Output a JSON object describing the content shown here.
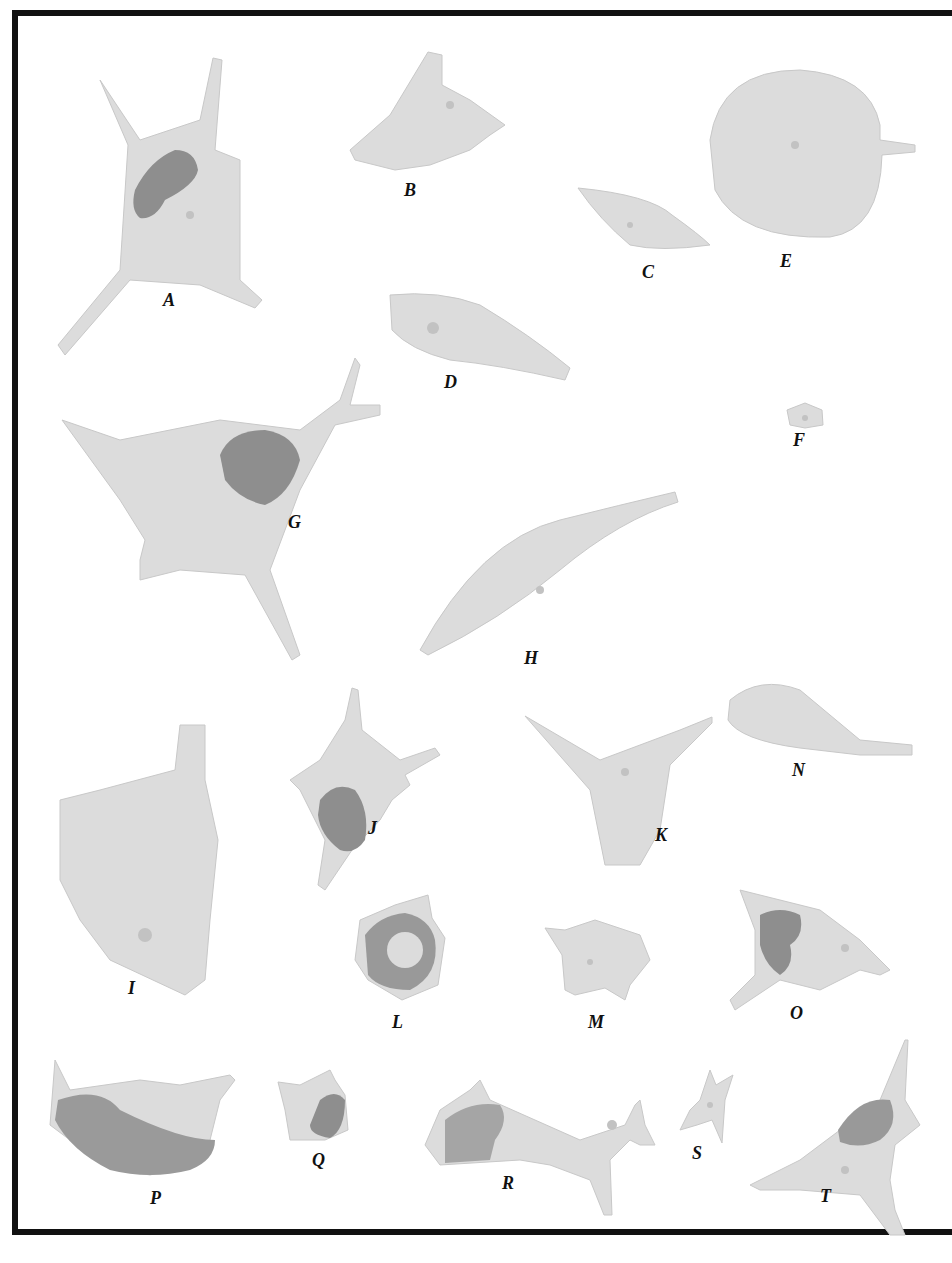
{
  "figure": {
    "colors": {
      "cell": "#dcdcdc",
      "cell_edge": "#c4c4c4",
      "nucleus": "#8e8e8e",
      "border": "#111111",
      "background": "#ffffff"
    },
    "labels": [
      {
        "id": "A",
        "x": 163,
        "y": 290
      },
      {
        "id": "B",
        "x": 404,
        "y": 180
      },
      {
        "id": "C",
        "x": 642,
        "y": 262
      },
      {
        "id": "D",
        "x": 444,
        "y": 372
      },
      {
        "id": "E",
        "x": 780,
        "y": 251
      },
      {
        "id": "F",
        "x": 793,
        "y": 430
      },
      {
        "id": "G",
        "x": 288,
        "y": 512
      },
      {
        "id": "H",
        "x": 524,
        "y": 648
      },
      {
        "id": "I",
        "x": 128,
        "y": 978
      },
      {
        "id": "J",
        "x": 368,
        "y": 818
      },
      {
        "id": "K",
        "x": 655,
        "y": 825
      },
      {
        "id": "L",
        "x": 392,
        "y": 1012
      },
      {
        "id": "M",
        "x": 588,
        "y": 1012
      },
      {
        "id": "N",
        "x": 792,
        "y": 760
      },
      {
        "id": "O",
        "x": 790,
        "y": 1003
      },
      {
        "id": "P",
        "x": 150,
        "y": 1188
      },
      {
        "id": "Q",
        "x": 312,
        "y": 1150
      },
      {
        "id": "R",
        "x": 502,
        "y": 1173
      },
      {
        "id": "S",
        "x": 692,
        "y": 1143
      },
      {
        "id": "T",
        "x": 820,
        "y": 1186
      }
    ]
  }
}
